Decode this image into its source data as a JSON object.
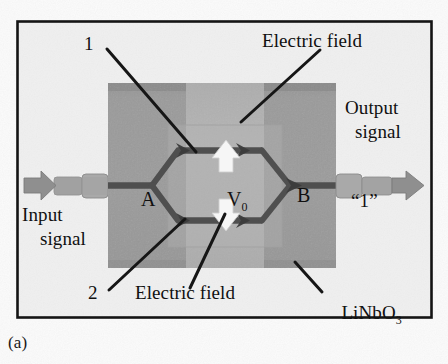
{
  "figure": {
    "caption": "(a)",
    "substrate_material_label": "LiNbO",
    "substrate_material_subscript": "3"
  },
  "labels": {
    "arm_top_number": "1",
    "arm_bottom_number": "2",
    "electric_field_top": "Electric field",
    "electric_field_bottom": "Electric field",
    "input_signal_line1": "Input",
    "input_signal_line2": "signal",
    "output_signal_line1": "Output",
    "output_signal_line2": "signal",
    "splitter_label": "A",
    "combiner_label": "B",
    "voltage_label": "V",
    "voltage_subscript": "0",
    "output_bit": "“1”"
  },
  "colors": {
    "border": "#141414",
    "page_background": "#ffffff",
    "panel_background": "#f1f1f1",
    "substrate_fill": "#9a9a9a",
    "substrate_top_band": "#7e7e7e",
    "electrode_fill": "#b3b3b3",
    "waveguide": "#4a4a4a",
    "leader_line": "#161616",
    "field_arrow": "#f5f5f5",
    "signal_arrow": "#8e8e8e",
    "text": "#101010"
  },
  "geometry": {
    "border_rect": [
      17,
      21,
      415,
      297
    ],
    "substrate_rect": [
      108,
      83,
      228,
      185
    ],
    "electrode_rect": [
      186,
      83,
      78,
      185
    ],
    "axis_y": 186
  }
}
